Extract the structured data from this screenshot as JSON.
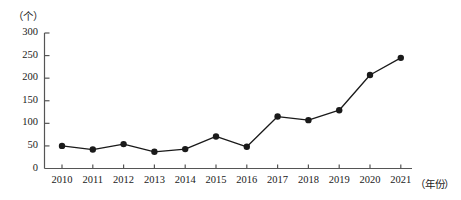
{
  "chart_data": {
    "type": "line",
    "title": "",
    "xlabel": "（年份）",
    "ylabel": "（个）",
    "categories": [
      "2010",
      "2011",
      "2012",
      "2013",
      "2014",
      "2015",
      "2016",
      "2017",
      "2018",
      "2019",
      "2020",
      "2021"
    ],
    "values": [
      50,
      42,
      54,
      37,
      43,
      71,
      48,
      115,
      107,
      129,
      207,
      245
    ],
    "series": [
      {
        "name": "数量",
        "values": [
          50,
          42,
          54,
          37,
          43,
          71,
          48,
          115,
          107,
          129,
          207,
          245
        ]
      }
    ],
    "ylim": [
      0,
      300
    ],
    "ytick_labels": [
      "0",
      "50",
      "100",
      "150",
      "200",
      "250",
      "300"
    ],
    "ytick_values": [
      0,
      50,
      100,
      150,
      200,
      250,
      300
    ],
    "xtick_labels": [
      "2010",
      "2011",
      "2012",
      "2013",
      "2014",
      "2015",
      "2016",
      "2017",
      "2018",
      "2019",
      "2020",
      "2021"
    ],
    "grid": false,
    "legend": "none",
    "marker": "filled-circle",
    "line_color": "#1a1a1a",
    "marker_color": "#1a1a1a",
    "axis_color": "#555555",
    "background_color": "#ffffff"
  }
}
